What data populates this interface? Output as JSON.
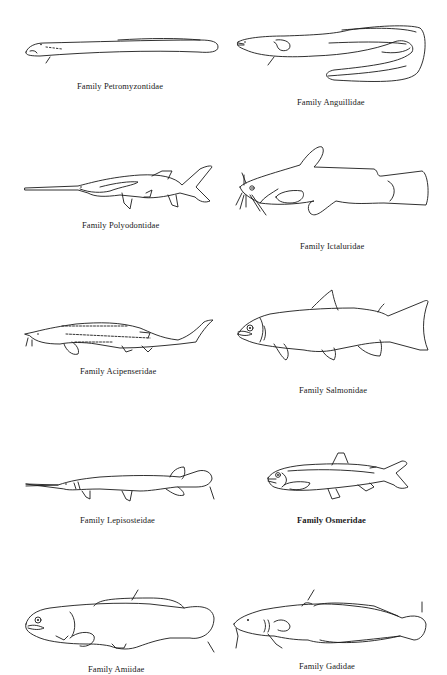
{
  "page": {
    "type": "illustration-plate",
    "figures": [
      {
        "id": "petromyzontidae",
        "caption": "Family Petromyzontidae",
        "column": "left",
        "row": 1
      },
      {
        "id": "anguillidae",
        "caption": "Family Anguillidae",
        "column": "right",
        "row": 1
      },
      {
        "id": "polyodontidae",
        "caption": "Family Polyodontidae",
        "column": "left",
        "row": 2
      },
      {
        "id": "ictaluridae",
        "caption": "Family Ictaluridae",
        "column": "right",
        "row": 2
      },
      {
        "id": "acipenseridae",
        "caption": "Family Acipenseridae",
        "column": "left",
        "row": 3
      },
      {
        "id": "salmonidae",
        "caption": "Family Salmonidae",
        "column": "right",
        "row": 3
      },
      {
        "id": "lepisosteidae",
        "caption": "Family Lepisosteidae",
        "column": "left",
        "row": 4
      },
      {
        "id": "osmeridae",
        "caption": "Family Osmeridae",
        "column": "right",
        "row": 4
      },
      {
        "id": "amiidae",
        "caption": "Family Amiidae",
        "column": "left",
        "row": 5
      },
      {
        "id": "gadidae",
        "caption": "Family Gadidae",
        "column": "right",
        "row": 5
      }
    ]
  }
}
